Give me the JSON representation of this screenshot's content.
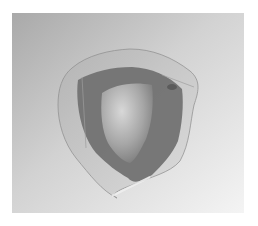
{
  "image": {
    "subject": "translucent tri-lobed ring object on gradient background",
    "colors": {
      "page_background": "#ffffff",
      "backdrop_dark": "#a8a8a8",
      "backdrop_light": "#f2f2f2",
      "outer_band": "#c9c9c9",
      "inner_band": "#6e6e6e",
      "center_highlight": "#d0d0d0",
      "center_shadow": "#8a8a8a"
    }
  }
}
